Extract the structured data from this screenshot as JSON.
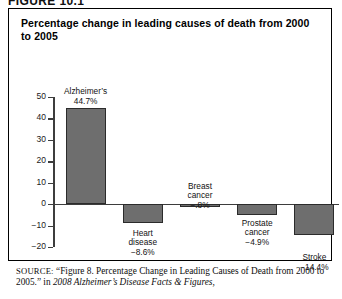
{
  "figure": {
    "label": "FIGURE 10.1"
  },
  "chart_title": "Percentage change in leading causes of death from 2000 to 2005",
  "source": {
    "keyword": "SOURCE:",
    "line1_plain": " “Figure 8. Percentage Change in Leading Causes of Death from",
    "line2_plain": "2000 to 2005.” in ",
    "line2_italic": "2008 Alzheimer’s Disease Facts & Figures,"
  },
  "chart_data": {
    "type": "bar",
    "title": "Percentage change in leading causes of death from 2000 to 2005",
    "xlabel": "",
    "ylabel": "",
    "ylim": [
      -20,
      50
    ],
    "yticks": [
      50,
      40,
      30,
      20,
      10,
      0,
      -10,
      -20
    ],
    "ytick_labels": [
      "50",
      "40",
      "30",
      "20",
      "10",
      "0",
      "−10",
      "−20"
    ],
    "grid": false,
    "legend": "none",
    "categories": [
      "Alzheimer’s",
      "Heart disease",
      "Breast cancer",
      "Prostate cancer",
      "Stroke"
    ],
    "values": [
      44.7,
      -8.6,
      -0.8,
      -4.9,
      -14.4
    ],
    "value_labels": [
      "44.7%",
      "−8.6%",
      "−.8%",
      "−4.9%",
      "−14.4%"
    ],
    "bar_color": "#6e6e6e",
    "bar_edge_color": "#2b2b2b",
    "axis_color": "#3d3d3d",
    "bars": [
      {
        "name": "Alzheimer’s",
        "line1": "Alzheimer’s",
        "line2": "44.7%",
        "value": 44.7
      },
      {
        "name": "Heart disease",
        "line1": "Heart",
        "line2": "disease",
        "line3": "−8.6%",
        "value": -8.6
      },
      {
        "name": "Breast cancer",
        "line1": "Breast",
        "line2": "cancer",
        "line3": "−.8%",
        "value": -0.8
      },
      {
        "name": "Prostate cancer",
        "line1": "Prostate",
        "line2": "cancer",
        "line3": "−4.9%",
        "value": -4.9
      },
      {
        "name": "Stroke",
        "line1": "Stroke",
        "line2": "−14.4%",
        "value": -14.4
      }
    ]
  }
}
